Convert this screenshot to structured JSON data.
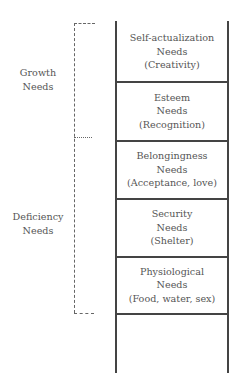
{
  "diagram": {
    "type": "ladder-hierarchy",
    "groups": [
      {
        "label_line1": "Growth",
        "label_line2": "Needs"
      },
      {
        "label_line1": "Deficiency",
        "label_line2": "Needs"
      }
    ],
    "levels": [
      {
        "name": "Self-actualization",
        "suffix": "Needs",
        "example": "(Creativity)"
      },
      {
        "name": "Esteem",
        "suffix": "Needs",
        "example": "(Recognition)"
      },
      {
        "name": "Belongingness",
        "suffix": "Needs",
        "example": "(Acceptance, love)"
      },
      {
        "name": "Security",
        "suffix": "Needs",
        "example": "(Shelter)"
      },
      {
        "name": "Physiological",
        "suffix": "Needs",
        "example": "(Food, water, sex)"
      }
    ]
  },
  "colors": {
    "line": "#444444",
    "text": "#555555",
    "bracket": "#666666"
  }
}
